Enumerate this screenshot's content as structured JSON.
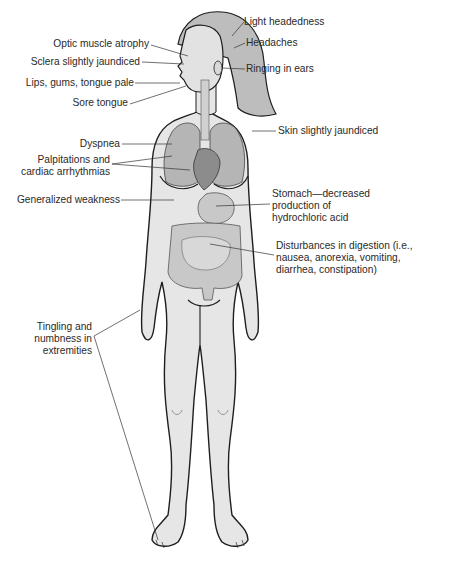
{
  "figure": {
    "colors": {
      "skin": "#e6e6e6",
      "outline": "#1e1e1e",
      "hair": "#b9b9b9",
      "lungs": "#b5b5b5",
      "heart": "#8c8c8c",
      "organs": "#c8c8c8",
      "leader_line": "#333333",
      "text": "#2a2a2a"
    }
  },
  "labels": {
    "light_headedness": "Light headedness",
    "headaches": "Headaches",
    "ringing_in_ears": "Ringing in ears",
    "optic_muscle_atrophy": "Optic muscle atrophy",
    "sclera_jaundiced": "Sclera slightly jaundiced",
    "lips_gums_tongue": "Lips, gums, tongue pale",
    "sore_tongue": "Sore tongue",
    "skin_jaundiced": "Skin slightly jaundiced",
    "dyspnea": "Dyspnea",
    "palpitations": "Palpitations and\ncardiac arrhythmias",
    "generalized_weakness": "Generalized weakness",
    "stomach": "Stomach—decreased\nproduction of\nhydrochloric acid",
    "digestion": "Disturbances in digestion (i.e.,\nnausea, anorexia, vomiting,\ndiarrhea, constipation)",
    "tingling": "Tingling and\nnumbness in\nextremities"
  }
}
